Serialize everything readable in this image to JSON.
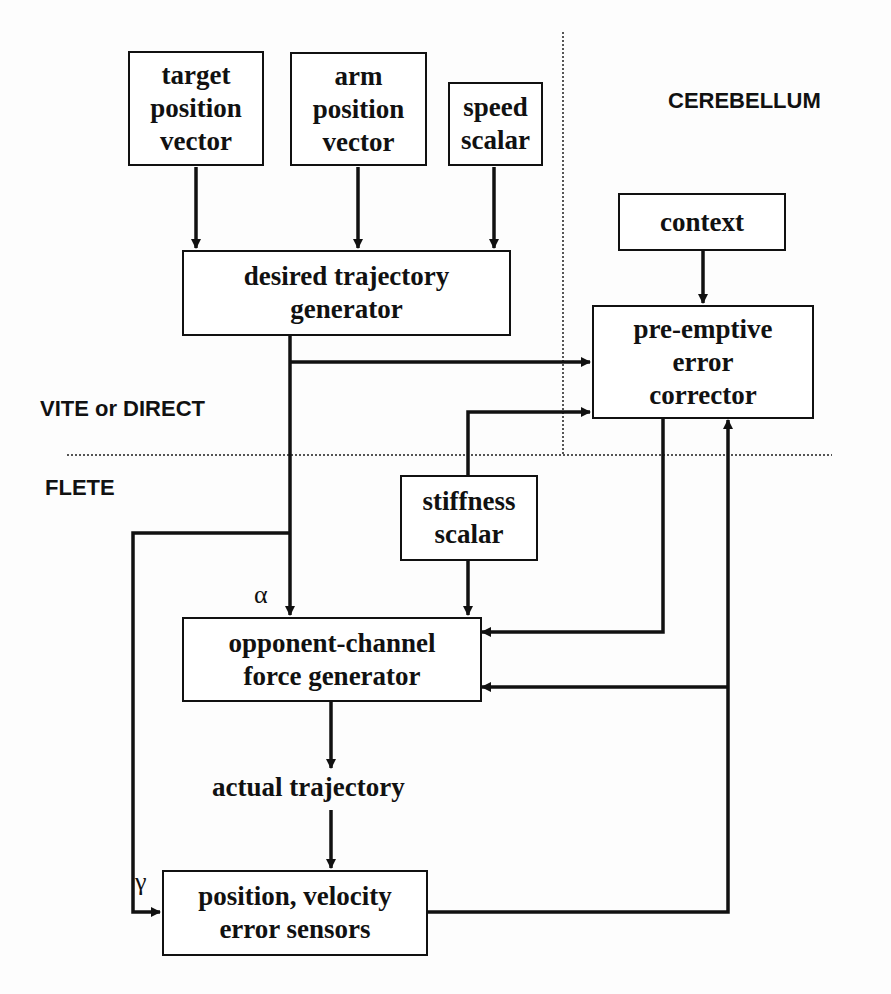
{
  "regions": {
    "cerebellum": "CEREBELLUM",
    "vite_direct": "VITE or DIRECT",
    "flete": "FLETE"
  },
  "boxes": {
    "target_position_vector": [
      "target",
      "position",
      "vector"
    ],
    "arm_position_vector": [
      "arm",
      "position",
      "vector"
    ],
    "speed_scalar": [
      "speed",
      "scalar"
    ],
    "desired_trajectory_generator": [
      "desired trajectory",
      "generator"
    ],
    "context": [
      "context"
    ],
    "pre_emptive_error_corrector": [
      "pre-emptive",
      "error",
      "corrector"
    ],
    "stiffness_scalar": [
      "stiffness",
      "scalar"
    ],
    "opponent_channel_force_generator": [
      "opponent-channel",
      "force generator"
    ],
    "position_velocity_error_sensors": [
      "position, velocity",
      "error sensors"
    ]
  },
  "labels": {
    "actual_trajectory": "actual trajectory",
    "alpha": "α",
    "gamma": "γ"
  },
  "colors": {
    "ink": "#111111",
    "divider": "#555555",
    "background": "#fdfdfd"
  }
}
